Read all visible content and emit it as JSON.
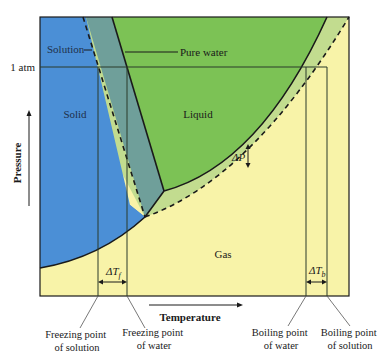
{
  "diagram": {
    "type": "phase_diagram",
    "colors": {
      "solid_region": "#4b8fd6",
      "solution_solid_band": "#6f9f9a",
      "liquid_region": "#7cc255",
      "liquid_solution_band": "#c2dc8f",
      "gas_region": "#f8f3a8",
      "boundary_line": "#1a1a1a",
      "guide_line": "#2b3a2b"
    },
    "regions": {
      "solid": "Solid",
      "liquid": "Liquid",
      "gas": "Gas"
    },
    "curve_labels": {
      "solution": "Solution",
      "pure_water": "Pure water"
    },
    "pressure_marker": "1 atm",
    "delta_labels": {
      "delta_p": "ΔP",
      "delta_tf": "ΔT",
      "delta_tf_sub": "f",
      "delta_tb": "ΔT",
      "delta_tb_sub": "b"
    },
    "axes": {
      "y_label": "Pressure",
      "x_label": "Temperature"
    },
    "callouts": {
      "freezing_solution": [
        "Freezing point",
        "of solution"
      ],
      "freezing_water": [
        "Freezing point",
        "of water"
      ],
      "boiling_water": [
        "Boiling point",
        "of water"
      ],
      "boiling_solution": [
        "Boiling point",
        "of solution"
      ]
    }
  }
}
